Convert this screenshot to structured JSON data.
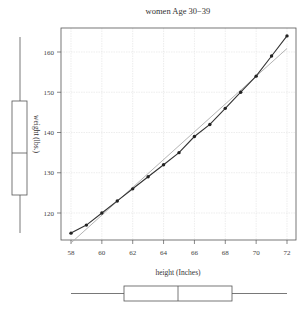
{
  "chart_data": {
    "type": "scatter",
    "title": "women Age 30−39",
    "xlabel": "height (Inches)",
    "ylabel": "weight (lbs.)",
    "xlim": [
      57.6,
      72.6
    ],
    "ylim": [
      113,
      166
    ],
    "grid": true,
    "x_ticks": [
      58,
      60,
      62,
      64,
      66,
      68,
      70,
      72
    ],
    "y_ticks": [
      120,
      130,
      140,
      150,
      160
    ],
    "series": [
      {
        "name": "observations",
        "type": "scatter+line",
        "x": [
          58,
          59,
          60,
          61,
          62,
          63,
          64,
          65,
          66,
          67,
          68,
          69,
          70,
          71,
          72
        ],
        "y": [
          115,
          117,
          120,
          123,
          126,
          129,
          132,
          135,
          139,
          142,
          146,
          150,
          154,
          159,
          164
        ]
      },
      {
        "name": "linear fit",
        "type": "line",
        "x": [
          58,
          72
        ],
        "y": [
          112.58,
          160.88
        ]
      }
    ],
    "marginal_boxplots": {
      "weight": {
        "min": 115,
        "q1": 124.5,
        "median": 135,
        "q3": 148,
        "max": 164,
        "position": "left"
      },
      "height": {
        "min": 58,
        "q1": 61.5,
        "median": 65,
        "q3": 68.5,
        "max": 72,
        "position": "bottom"
      }
    }
  },
  "labels": {
    "title": "women Age 30−39",
    "xlabel": "height (Inches)",
    "ylabel": "weight (lbs.)",
    "x_ticks": [
      "58",
      "60",
      "62",
      "64",
      "66",
      "68",
      "70",
      "72"
    ],
    "y_ticks": [
      "120",
      "130",
      "140",
      "150",
      "160"
    ]
  },
  "colors": {
    "points": "#222222",
    "curve": "#333333",
    "fit_line": "#aaaaaa",
    "grid": "#dddddd",
    "box": "#555555"
  }
}
